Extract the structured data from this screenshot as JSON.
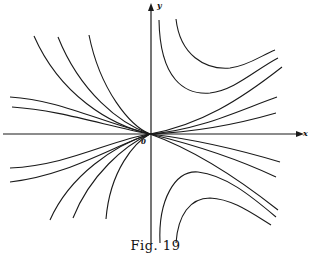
{
  "figure": {
    "caption": "Fig. 19",
    "axis_labels": {
      "x": "x",
      "y": "y",
      "origin": "0"
    },
    "stroke_color": "#1a1a1a",
    "background": "#ffffff"
  },
  "diagram": {
    "type": "phase portrait (node at origin with trajectories)",
    "origin_px": [
      150,
      134
    ],
    "curves": [
      {
        "region": "upper-left",
        "kind": "steep",
        "path": "M34,36 C60,95 110,125 150,134"
      },
      {
        "region": "upper-left",
        "kind": "steep",
        "path": "M58,37 C80,92 120,124 150,134"
      },
      {
        "region": "upper-left",
        "kind": "steep",
        "path": "M89,35 C100,90 130,126 150,134"
      },
      {
        "region": "upper-left",
        "kind": "flat",
        "path": "M10,97 C60,100 100,122 150,134"
      },
      {
        "region": "upper-left",
        "kind": "flat",
        "path": "M12,107 C60,110 110,127 150,134"
      },
      {
        "region": "upper-right",
        "kind": "ray",
        "path": "M150,134 C200,125 240,100 282,67"
      },
      {
        "region": "upper-right",
        "kind": "ray",
        "path": "M150,134 C200,130 240,110 277,97"
      },
      {
        "region": "upper-right",
        "kind": "ray",
        "path": "M150,134 C200,132 245,122 276,113"
      },
      {
        "region": "upper-right",
        "kind": "hyperbolic",
        "path": "M159,20 C160,80 185,95 210,93 C235,90 255,70 278,58"
      },
      {
        "region": "upper-right",
        "kind": "hyperbolic",
        "path": "M176,19 C180,55 205,70 230,68 C248,66 262,55 275,50"
      },
      {
        "region": "lower-left",
        "kind": "flat",
        "path": "M10,168 C70,165 110,140 150,134"
      },
      {
        "region": "lower-left",
        "kind": "flat",
        "path": "M10,182 C70,175 115,145 150,134"
      },
      {
        "region": "lower-left",
        "kind": "steep",
        "path": "M50,220 C70,175 115,145 150,134"
      },
      {
        "region": "lower-left",
        "kind": "steep",
        "path": "M73,218 C90,175 125,145 150,134"
      },
      {
        "region": "lower-left",
        "kind": "steep",
        "path": "M106,219 C110,170 135,142 150,134"
      },
      {
        "region": "lower-right",
        "kind": "ray",
        "path": "M150,134 C200,140 240,150 280,162"
      },
      {
        "region": "lower-right",
        "kind": "ray",
        "path": "M150,134 C195,145 240,160 276,177"
      },
      {
        "region": "lower-right",
        "kind": "ray",
        "path": "M150,134 C195,150 240,180 278,210"
      },
      {
        "region": "lower-right",
        "kind": "hyperbolic",
        "path": "M160,243 C158,200 175,170 198,172 C225,175 250,195 276,217"
      },
      {
        "region": "lower-right",
        "kind": "hyperbolic",
        "path": "M176,243 C178,215 190,198 210,198 C232,199 250,212 271,225"
      }
    ]
  }
}
